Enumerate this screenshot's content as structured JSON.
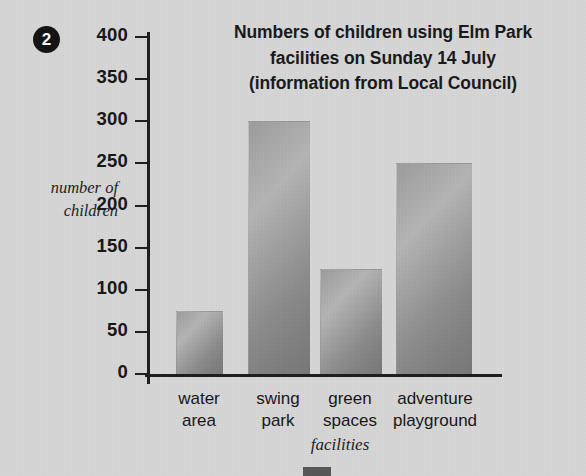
{
  "question_number": "2",
  "chart_data": {
    "type": "bar",
    "title": "Numbers of children using Elm Park facilities on Sunday 14 July (information from Local Council)",
    "title_lines": [
      "Numbers of children using Elm Park",
      "facilities on Sunday 14 July",
      "(information from Local Council)"
    ],
    "categories": [
      "water area",
      "swing park",
      "green spaces",
      "adventure playground"
    ],
    "category_lines": [
      [
        "water",
        "area"
      ],
      [
        "swing",
        "park"
      ],
      [
        "green",
        "spaces"
      ],
      [
        "adventure",
        "playground"
      ]
    ],
    "values": [
      75,
      300,
      125,
      250
    ],
    "xlabel": "facilities",
    "ylabel": "number of children",
    "ylabel_lines": [
      "number of",
      "children"
    ],
    "ylim": [
      0,
      400
    ],
    "ytick_step": 50,
    "yticks": [
      0,
      50,
      100,
      150,
      200,
      250,
      300,
      350,
      400
    ],
    "ytick_labels": [
      "0",
      "50",
      "100",
      "150",
      "200",
      "250",
      "300",
      "350",
      "400"
    ],
    "grid": false,
    "legend": null,
    "bar_color": "#969696",
    "axis_color": "#1b1b1b",
    "background_color": "#d6d6d6"
  }
}
